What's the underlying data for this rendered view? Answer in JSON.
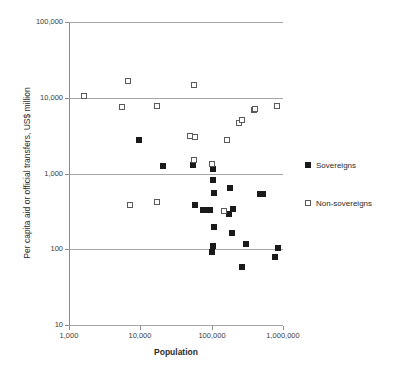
{
  "chart_data": {
    "type": "scatter",
    "title": "",
    "xlabel": "Population",
    "ylabel": "Per capita aid or official transfers, US$ million",
    "xscale": "log",
    "yscale": "log",
    "xlim": [
      1000,
      1000000
    ],
    "ylim": [
      10,
      100000
    ],
    "grid": true,
    "gridlines_y": [
      10,
      100,
      1000,
      10000,
      100000
    ],
    "xticks": [
      1000,
      10000,
      100000,
      1000000
    ],
    "xtick_labels": [
      "1,000",
      "10,000",
      "100,000",
      "1,000,000"
    ],
    "yticks": [
      10,
      100,
      1000,
      10000,
      100000
    ],
    "ytick_labels": [
      "10",
      "100",
      "1,000",
      "10,000",
      "100,000"
    ],
    "legend_position": "right",
    "series": [
      {
        "name": "Sovereigns",
        "marker": "filled-square",
        "color": "#1a1a1a",
        "points": [
          [
            9500,
            2800
          ],
          [
            21000,
            1270
          ],
          [
            55000,
            1300
          ],
          [
            103000,
            1140
          ],
          [
            105000,
            810
          ],
          [
            108000,
            560
          ],
          [
            59000,
            380
          ],
          [
            75000,
            330
          ],
          [
            84000,
            330
          ],
          [
            94000,
            335
          ],
          [
            180000,
            640
          ],
          [
            190000,
            165
          ],
          [
            175000,
            295
          ],
          [
            200000,
            340
          ],
          [
            108000,
            195
          ],
          [
            104000,
            110
          ],
          [
            100000,
            93
          ],
          [
            265000,
            58
          ],
          [
            300000,
            118
          ],
          [
            480000,
            540
          ],
          [
            520000,
            545
          ],
          [
            760000,
            78
          ],
          [
            840000,
            103
          ]
        ]
      },
      {
        "name": "Non-sovereigns",
        "marker": "open-square",
        "color": "#5a5a5a",
        "points": [
          [
            1600,
            10500
          ],
          [
            6800,
            16500
          ],
          [
            5600,
            7600
          ],
          [
            17000,
            7900
          ],
          [
            57000,
            14800
          ],
          [
            50000,
            3150
          ],
          [
            58000,
            3000
          ],
          [
            56000,
            1530
          ],
          [
            102000,
            1320
          ],
          [
            165000,
            2800
          ],
          [
            240000,
            4600
          ],
          [
            265000,
            5100
          ],
          [
            390000,
            7000
          ],
          [
            400000,
            7050
          ],
          [
            820000,
            7900
          ],
          [
            7200,
            390
          ],
          [
            17000,
            415
          ],
          [
            150000,
            325
          ]
        ]
      }
    ]
  },
  "legend": {
    "items": [
      {
        "label": "Sovereigns",
        "marker": "filled-square"
      },
      {
        "label": "Non-sovereigns",
        "marker": "open-square"
      }
    ]
  }
}
